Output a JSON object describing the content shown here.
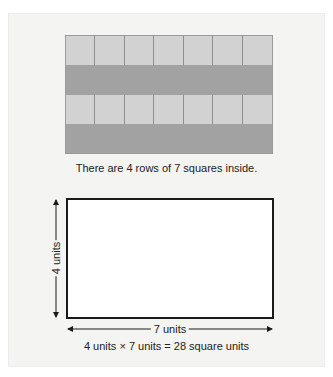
{
  "top_figure": {
    "grid": {
      "rows": 4,
      "columns": 7,
      "row_shades": [
        "light",
        "dark",
        "light",
        "dark"
      ],
      "light_color": "#d2d2d2",
      "dark_color": "#a2a2a2"
    },
    "caption": "There are 4 rows of 7 squares inside."
  },
  "bottom_figure": {
    "height_label": "4 units",
    "width_label": "7 units",
    "equation": "4 units × 7 units = 28 square units"
  }
}
